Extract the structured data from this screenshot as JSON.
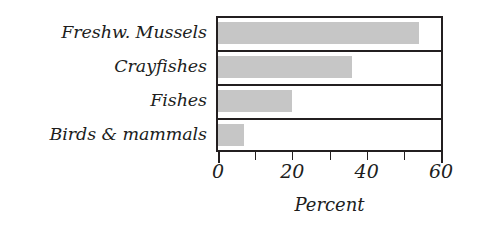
{
  "chart_data": {
    "type": "bar",
    "orientation": "horizontal",
    "title": "",
    "xlabel": "Percent",
    "ylabel": "",
    "categories": [
      "Freshw. Mussels",
      "Crayfishes",
      "Fishes",
      "Birds & mammals"
    ],
    "values": [
      54,
      36,
      20,
      7
    ],
    "xlim": [
      0,
      60
    ],
    "xticks": [
      0,
      10,
      20,
      30,
      40,
      50,
      60
    ],
    "xtick_labels": [
      "0",
      "",
      "20",
      "",
      "40",
      "",
      "60"
    ],
    "grid": false,
    "legend": null,
    "bar_color": "#c6c6c6",
    "frame_color": "#231f20",
    "text_color": "#201d1c",
    "background": "#ffffff"
  }
}
